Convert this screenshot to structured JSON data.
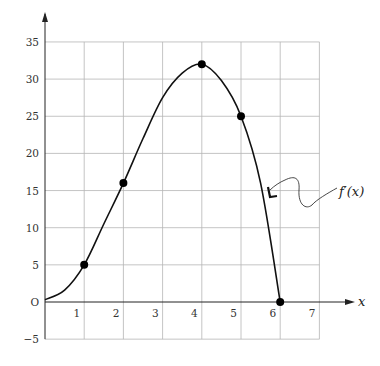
{
  "chart_data": {
    "type": "line",
    "title": "",
    "xlabel": "x",
    "ylabel": "",
    "origin_label": "O",
    "xlim": [
      0,
      7
    ],
    "ylim": [
      -5,
      35
    ],
    "grid": true,
    "x_ticks": [
      1,
      2,
      3,
      4,
      5,
      6,
      7
    ],
    "x_tick_labels": [
      "1",
      "2",
      "3",
      "4",
      "5",
      "6",
      "7"
    ],
    "y_ticks": [
      -5,
      5,
      10,
      15,
      20,
      25,
      30,
      35
    ],
    "y_tick_labels": [
      "−5",
      "5",
      "10",
      "15",
      "20",
      "25",
      "30",
      "35"
    ],
    "series": [
      {
        "name": "f'(x)",
        "curve": [
          [
            0,
            0.3
          ],
          [
            0.5,
            1.6
          ],
          [
            1,
            5
          ],
          [
            1.5,
            10.5
          ],
          [
            2,
            16
          ],
          [
            2.5,
            22
          ],
          [
            3,
            27.5
          ],
          [
            3.5,
            30.8
          ],
          [
            4,
            32
          ],
          [
            4.5,
            29.8
          ],
          [
            5,
            25
          ],
          [
            5.5,
            16
          ],
          [
            6,
            0
          ]
        ],
        "marked_points": [
          [
            1,
            5
          ],
          [
            2,
            16
          ],
          [
            4,
            32
          ],
          [
            5,
            25
          ],
          [
            6,
            0
          ]
        ]
      }
    ],
    "annotations": [
      {
        "text": "f′(x)",
        "points_to": "curve between x=5 and x=6",
        "arrow": "wavy"
      }
    ]
  }
}
